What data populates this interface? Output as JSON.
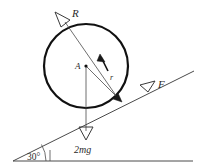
{
  "figure": {
    "kind": "free-body-diagram",
    "background_color": "#ffffff",
    "ink_color": "#2a2a2a",
    "circle_color": "#111111"
  },
  "labels": {
    "normal_reaction": "R",
    "friction_force": "F",
    "center_point": "A",
    "radius": "r",
    "tension": "T",
    "weight": "2mg",
    "incline_angle": "30°"
  },
  "geometry": {
    "circle": {
      "cx": 86,
      "cy": 66,
      "r": 42
    },
    "incline": {
      "x1": 13,
      "y1": 161,
      "x2": 193,
      "y2": 72,
      "angle_deg": 30
    },
    "ground": {
      "x1": 13,
      "y1": 161,
      "x2": 193,
      "y2": 161
    },
    "contact_point": {
      "x": 117,
      "y": 97
    },
    "normal_arrow_tip": {
      "x": 62,
      "y": 17
    },
    "friction_arrow_tip": {
      "x": 158,
      "y": 88
    },
    "weight_arrow_tip": {
      "x": 86,
      "y": 138
    },
    "tension_arrow_tip": {
      "x": 102,
      "y": 56
    },
    "radius_line_end": {
      "x": 121,
      "y": 101
    }
  }
}
